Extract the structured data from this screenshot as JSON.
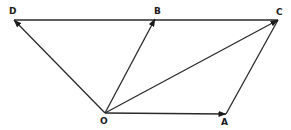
{
  "diagram": {
    "type": "vector-parallelogram",
    "points": {
      "O": {
        "label": "O",
        "x": 105,
        "y": 113,
        "lx": 100,
        "ly": 124
      },
      "A": {
        "label": "A",
        "x": 226,
        "y": 114,
        "lx": 221,
        "ly": 125
      },
      "B": {
        "label": "B",
        "x": 155,
        "y": 19,
        "lx": 154,
        "ly": 14
      },
      "C": {
        "label": "C",
        "x": 278,
        "y": 20,
        "lx": 276,
        "ly": 15
      },
      "D": {
        "label": "D",
        "x": 14,
        "y": 20,
        "lx": 9,
        "ly": 14
      }
    },
    "segments": [
      {
        "from": "D",
        "to": "C",
        "arrow": false
      },
      {
        "from": "A",
        "to": "C",
        "arrow": false
      }
    ],
    "vectors": [
      {
        "from": "O",
        "to": "D",
        "arrow": true
      },
      {
        "from": "O",
        "to": "B",
        "arrow": true
      },
      {
        "from": "O",
        "to": "C",
        "arrow": true
      },
      {
        "from": "O",
        "to": "A",
        "arrow": true
      }
    ],
    "line_color": "#2a2a2a"
  }
}
